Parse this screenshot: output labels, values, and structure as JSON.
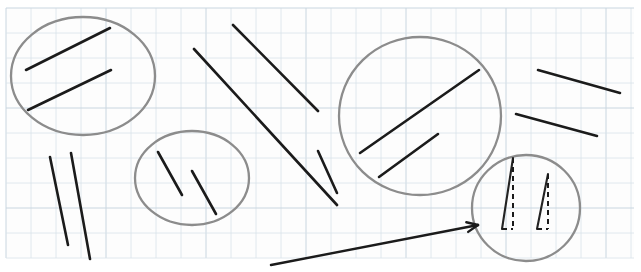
{
  "canvas": {
    "width": 641,
    "height": 272,
    "background_color": "#ffffff",
    "title": "Parallel line segments grouped on graph paper"
  },
  "paper": {
    "name": "graph-paper",
    "fill_color": "#fdfdfd",
    "x": 6,
    "y": 8,
    "width": 628,
    "height": 250,
    "grid_spacing": 25,
    "grid_color": "#d8e2ea",
    "grid_major_color": "#c9d6e0"
  },
  "ink": {
    "line_color": "#1b1b1b",
    "circle_color": "#8c8c8c",
    "dashed_color": "#1b1b1b"
  },
  "circles": [
    {
      "id": "circle-upper-left",
      "label": "group-1",
      "cx": 83,
      "cy": 76,
      "rx": 72,
      "ry": 59
    },
    {
      "id": "circle-middle",
      "label": "group-2",
      "cx": 192,
      "cy": 178,
      "rx": 57,
      "ry": 47
    },
    {
      "id": "circle-upper-right",
      "label": "group-3",
      "cx": 420,
      "cy": 116,
      "rx": 81,
      "ry": 79
    },
    {
      "id": "circle-lower-right",
      "label": "group-4",
      "cx": 526,
      "cy": 208,
      "rx": 54,
      "ry": 53
    }
  ],
  "segments": [
    {
      "id": "seg-g1-a",
      "group": "group-1",
      "x1": 26,
      "y1": 70,
      "x2": 110,
      "y2": 28
    },
    {
      "id": "seg-g1-b",
      "group": "group-1",
      "x1": 28,
      "y1": 110,
      "x2": 111,
      "y2": 70
    },
    {
      "id": "seg-free-a",
      "group": "free-upper-middle",
      "x1": 194,
      "y1": 49,
      "x2": 337,
      "y2": 205
    },
    {
      "id": "seg-free-b",
      "group": "free-upper-middle",
      "x1": 233,
      "y1": 25,
      "x2": 318,
      "y2": 111
    },
    {
      "id": "seg-free-c",
      "group": "free-left-lower",
      "x1": 50,
      "y1": 157,
      "x2": 68,
      "y2": 245
    },
    {
      "id": "seg-free-d",
      "group": "free-left-lower",
      "x1": 71,
      "y1": 153,
      "x2": 90,
      "y2": 259
    },
    {
      "id": "seg-g2-a",
      "group": "group-2",
      "x1": 158,
      "y1": 152,
      "x2": 182,
      "y2": 195
    },
    {
      "id": "seg-g2-b",
      "group": "group-2",
      "x1": 192,
      "y1": 171,
      "x2": 216,
      "y2": 214
    },
    {
      "id": "seg-g3-a",
      "group": "group-3",
      "x1": 360,
      "y1": 153,
      "x2": 479,
      "y2": 70
    },
    {
      "id": "seg-g3-b",
      "group": "group-3",
      "x1": 379,
      "y1": 177,
      "x2": 438,
      "y2": 134
    },
    {
      "id": "seg-free-e",
      "group": "free-right",
      "x1": 538,
      "y1": 70,
      "x2": 620,
      "y2": 93
    },
    {
      "id": "seg-free-f",
      "group": "free-right",
      "x1": 516,
      "y1": 114,
      "x2": 597,
      "y2": 136
    },
    {
      "id": "seg-free-g",
      "group": "free-right",
      "x1": 318,
      "y1": 151,
      "x2": 337,
      "y2": 193
    }
  ],
  "triangles": [
    {
      "id": "triangle-left",
      "apex_x": 513,
      "apex_y": 158,
      "base_left_x": 502,
      "base_left_y": 229,
      "base_right_x": 513,
      "base_right_y": 229,
      "solid_edge": "hypotenuse",
      "dashed_edges": [
        "vertical-leg",
        "horizontal-leg"
      ]
    },
    {
      "id": "triangle-right",
      "apex_x": 548,
      "apex_y": 174,
      "base_left_x": 537,
      "base_left_y": 229,
      "base_right_x": 548,
      "base_right_y": 229,
      "solid_edge": "hypotenuse",
      "dashed_edges": [
        "vertical-leg",
        "horizontal-leg"
      ]
    }
  ],
  "arrow": {
    "id": "pointer-arrow",
    "x1": 271,
    "y1": 265,
    "x2": 478,
    "y2": 225,
    "head_length": 12,
    "color": "#1b1b1b",
    "points_to": "circle-lower-right"
  }
}
